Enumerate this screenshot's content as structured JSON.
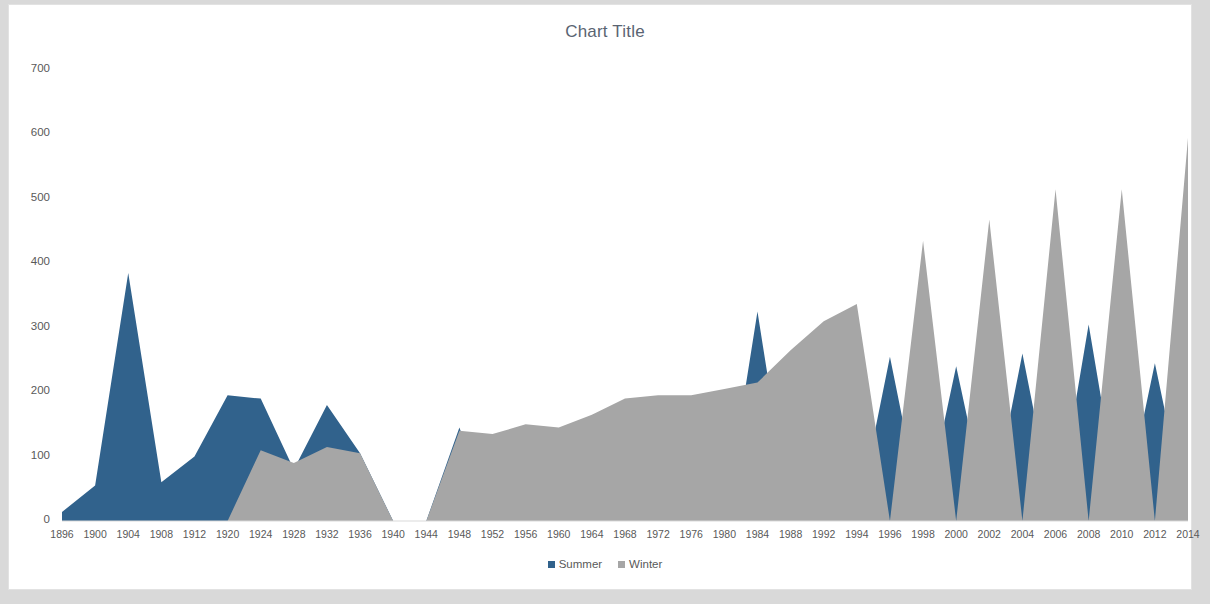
{
  "chart": {
    "title": "Chart Title",
    "legend": [
      {
        "label": "Summer",
        "color": "#31628c"
      },
      {
        "label": "Winter",
        "color": "#a6a6a6"
      }
    ]
  },
  "chart_data": {
    "type": "area",
    "title": "Chart Title",
    "xlabel": "",
    "ylabel": "",
    "ylim": [
      0,
      700
    ],
    "ytick_labels": [
      "0",
      "100",
      "200",
      "300",
      "400",
      "500",
      "600",
      "700"
    ],
    "ytick_values": [
      0,
      100,
      200,
      300,
      400,
      500,
      600,
      700
    ],
    "grid": false,
    "legend_position": "bottom",
    "categories": [
      "1896",
      "1900",
      "1904",
      "1908",
      "1912",
      "1920",
      "1924",
      "1928",
      "1932",
      "1936",
      "1940",
      "1944",
      "1948",
      "1952",
      "1956",
      "1960",
      "1964",
      "1968",
      "1972",
      "1976",
      "1980",
      "1984",
      "1988",
      "1992",
      "1994",
      "1996",
      "1998",
      "2000",
      "2002",
      "2004",
      "2006",
      "2008",
      "2010",
      "2012",
      "2014"
    ],
    "series": [
      {
        "name": "Summer",
        "color": "#31628c",
        "values": [
          14,
          55,
          385,
          60,
          100,
          195,
          190,
          80,
          180,
          105,
          0,
          0,
          145,
          0,
          0,
          0,
          0,
          0,
          0,
          0,
          0,
          325,
          0,
          220,
          0,
          255,
          0,
          240,
          0,
          260,
          0,
          305,
          0,
          245,
          0
        ]
      },
      {
        "name": "Winter",
        "color": "#a6a6a6",
        "values": [
          0,
          0,
          0,
          0,
          0,
          0,
          110,
          90,
          115,
          105,
          0,
          0,
          140,
          135,
          150,
          145,
          165,
          190,
          195,
          195,
          205,
          215,
          265,
          310,
          337,
          0,
          435,
          0,
          468,
          0,
          515,
          0,
          515,
          0,
          595
        ]
      }
    ]
  }
}
